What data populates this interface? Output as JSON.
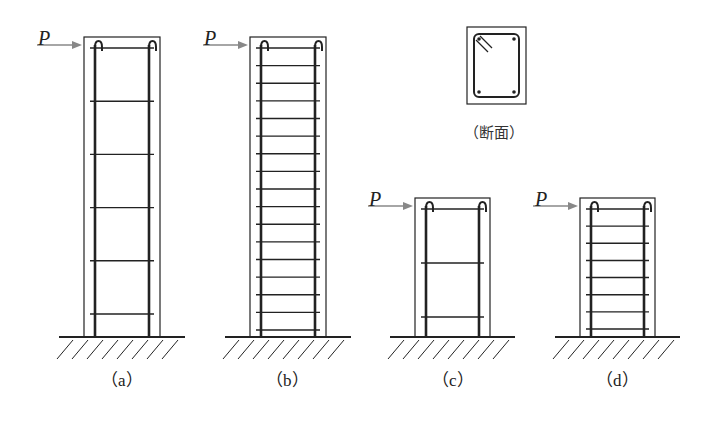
{
  "figure": {
    "load_label": "P",
    "section_caption": "（断面）",
    "columns": [
      {
        "id": "a",
        "caption": "（a）",
        "ties": 6,
        "x": 84,
        "width": 76,
        "top": 37
      },
      {
        "id": "b",
        "caption": "（b）",
        "ties": 17,
        "x": 250,
        "width": 76,
        "top": 37
      },
      {
        "id": "c",
        "caption": "（c）",
        "ties": 3,
        "x": 415,
        "width": 75,
        "top": 198
      },
      {
        "id": "d",
        "caption": "（d）",
        "ties": 8,
        "x": 580,
        "width": 75,
        "top": 198
      }
    ],
    "colors": {
      "line": "#222222",
      "arrow": "#888888"
    }
  }
}
